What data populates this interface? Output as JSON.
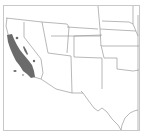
{
  "map": {
    "type": "species-range-map",
    "region": "Southwestern United States",
    "colors": {
      "background": "#ffffff",
      "border": "#c8c8c8",
      "state_lines": "#9a9a9a",
      "range_fill": "#6b6b6b"
    },
    "states_shown": [
      "California",
      "Oregon",
      "Nevada",
      "Idaho",
      "Utah",
      "Arizona",
      "Wyoming",
      "Colorado",
      "New Mexico",
      "Nebraska",
      "Kansas",
      "Oklahoma",
      "Texas",
      "Iowa",
      "Missouri"
    ],
    "range_description": "Coastal and central California (Coast Ranges, Central Valley margins), with small isolated patches"
  }
}
